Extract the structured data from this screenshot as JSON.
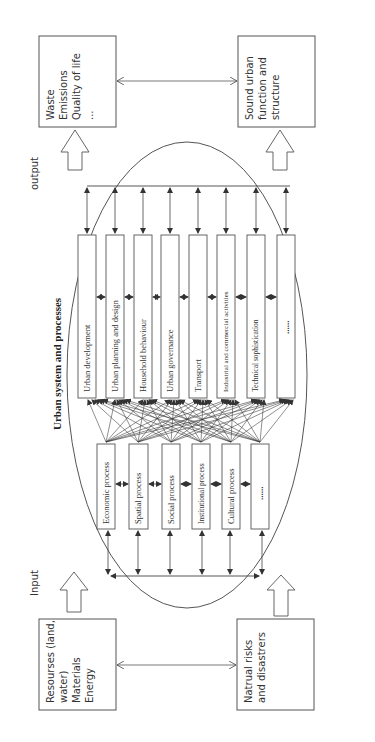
{
  "diagram": {
    "title": "Urban system and processes",
    "labels": {
      "input": "Input",
      "output": "output"
    },
    "output_boxes": [
      {
        "lines": [
          "Waste",
          "Emissions",
          "Quality of life",
          "..."
        ]
      },
      {
        "lines": [
          "Sound urban",
          "function and",
          "structure"
        ]
      }
    ],
    "input_boxes": [
      {
        "lines": [
          "Resourses (land,",
          "water)",
          "Materials",
          "Energy"
        ]
      },
      {
        "lines": [
          "Natrual risks",
          "and disastrers"
        ]
      }
    ],
    "urban_functions": [
      "Urban development",
      "Urban planning and design",
      "Household behaviour",
      "Urban governance",
      "Transport",
      "Industrial and commercial activities",
      "Technical sophistication",
      "......"
    ],
    "processes": [
      "Economic process",
      "Spatial process",
      "Social process",
      "Institutional process",
      "Cultural process",
      "......"
    ],
    "colors": {
      "line": "#444444",
      "text": "#333333",
      "background": "#ffffff"
    }
  }
}
